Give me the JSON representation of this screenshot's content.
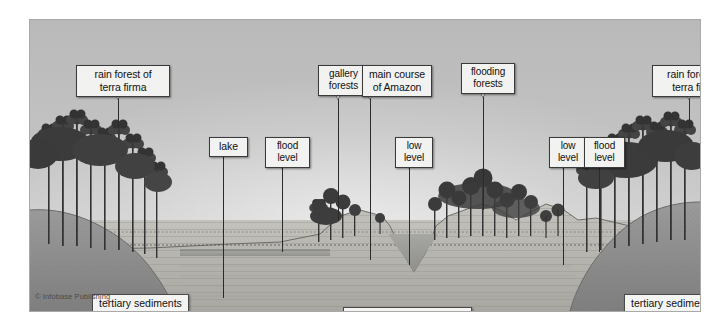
{
  "figure": {
    "copyright": "© Infobase Publishing"
  },
  "callouts": [
    {
      "name": "rain-forest-terra-firma-left",
      "text": "rain forest of\nterra firma",
      "x": 46,
      "y": 45,
      "w": 84,
      "leader_x": 88,
      "leader_top": 78,
      "leader_bottom": 108
    },
    {
      "name": "lake",
      "text": "lake",
      "x": 179,
      "y": 117,
      "w": 29,
      "leader_x": 193,
      "leader_top": 132,
      "leader_bottom": 278
    },
    {
      "name": "flood-level-left",
      "text": "flood\nlevel",
      "x": 235,
      "y": 117,
      "w": 35,
      "leader_x": 252,
      "leader_top": 147,
      "leader_bottom": 232
    },
    {
      "name": "gallery-forests",
      "text": "gallery\nforests",
      "x": 288,
      "y": 45,
      "w": 41,
      "leader_x": 308,
      "leader_top": 78,
      "leader_bottom": 200
    },
    {
      "name": "main-course-of-amazon",
      "text": "main course\nof Amazon",
      "x": 332,
      "y": 45,
      "w": 60,
      "leader_x": 340,
      "leader_top": 78,
      "leader_bottom": 240
    },
    {
      "name": "low-level-center",
      "text": "low\nlevel",
      "x": 365,
      "y": 117,
      "w": 28,
      "leader_x": 379,
      "leader_top": 147,
      "leader_bottom": 245
    },
    {
      "name": "flooding-forests",
      "text": "flooding\nforests",
      "x": 431,
      "y": 43,
      "w": 44,
      "leader_x": 453,
      "leader_top": 76,
      "leader_bottom": 190
    },
    {
      "name": "low-level-right",
      "text": "low\nlevel",
      "x": 519,
      "y": 117,
      "w": 28,
      "leader_x": 533,
      "leader_top": 147,
      "leader_bottom": 245
    },
    {
      "name": "flood-level-right",
      "text": "flood\nlevel",
      "x": 554,
      "y": 117,
      "w": 31,
      "leader_x": 569,
      "leader_top": 147,
      "leader_bottom": 232
    },
    {
      "name": "rain-forest-terra-firma-right",
      "text": "rain forest of\nterra firma",
      "x": 622,
      "y": 45,
      "w": 77,
      "leader_x": 659,
      "leader_top": 78,
      "leader_bottom": 108
    }
  ],
  "ground_labels": [
    {
      "name": "tertiary-sediments-left",
      "text": "tertiary sediments",
      "x": 62,
      "y": 274
    },
    {
      "name": "recent-alluvial-sediments",
      "text": "recent alluvial sediments",
      "x": 313,
      "y": 287
    },
    {
      "name": "tertiary-sediments-right",
      "text": "tertiary sediments",
      "x": 594,
      "y": 274
    }
  ],
  "colors": {
    "sky": "#c2c2c2",
    "tertiary_sediment": "#8d8d8d",
    "alluvial_sediment": "#b5b3ad",
    "water": "#9a9a96",
    "label_bg": "#f2f2f0",
    "label_border": "#3a3a3a"
  }
}
